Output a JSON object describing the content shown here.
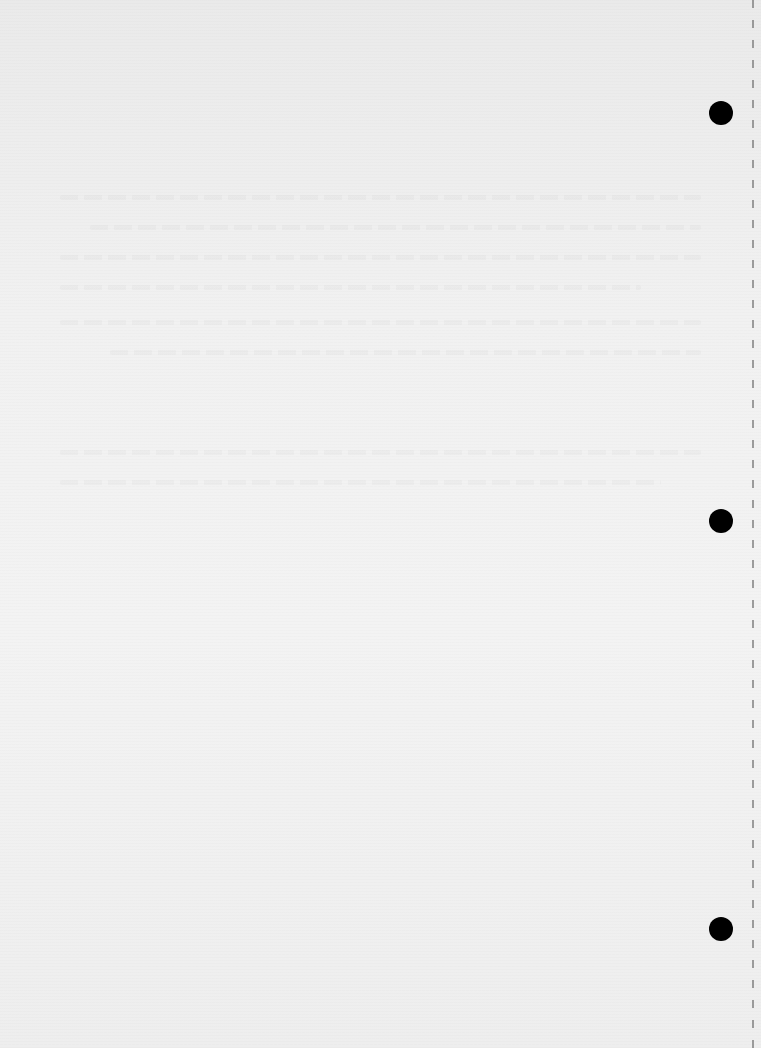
{
  "page": {
    "type": "blank scanned sheet",
    "background_color": "#efefef",
    "text": "",
    "punch_holes": [
      {
        "cx": 721,
        "cy": 113,
        "r": 12
      },
      {
        "cx": 721,
        "cy": 521,
        "r": 12
      },
      {
        "cx": 721,
        "cy": 929,
        "r": 12
      }
    ],
    "perforation_line": {
      "x": 753,
      "style": "dashed"
    }
  }
}
